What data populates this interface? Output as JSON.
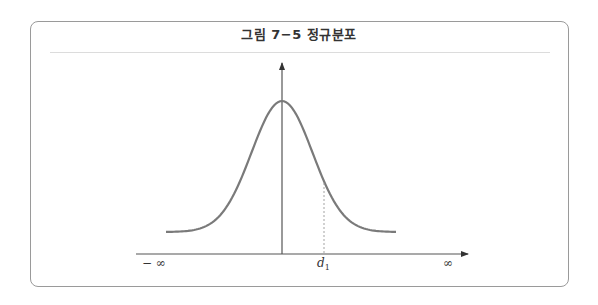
{
  "figure": {
    "title": "그림 7−5   정규분포",
    "colors": {
      "frame": "#9a9a9a",
      "axis": "#444444",
      "curve": "#777777",
      "dashed": "#999999"
    }
  },
  "chart_data": {
    "type": "line",
    "title": "그림 7−5 정규분포",
    "xlabel": "",
    "ylabel": "",
    "x_tick_labels": [
      "−∞",
      "d₁",
      "∞"
    ],
    "annotations": [
      {
        "label": "d₁",
        "type": "dashed vertical line",
        "x_relative_sigma": 1.4
      }
    ],
    "grid": false,
    "legend": null
  },
  "labels": {
    "neg_inf": "− ∞",
    "d1_main": "d",
    "d1_sub": "1",
    "pos_inf": "∞"
  }
}
